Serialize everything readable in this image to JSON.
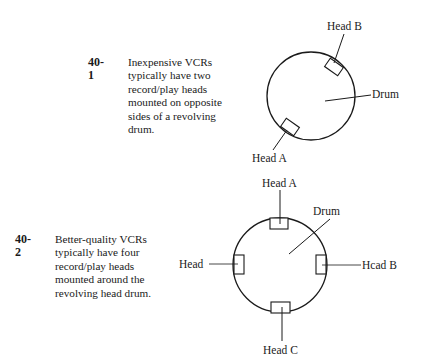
{
  "figures": [
    {
      "number": "40-1",
      "caption_lines": [
        "Inexpensive VCRs",
        "typically have two",
        "record/play heads",
        "mounted on opposite",
        "sides of a revolving",
        "drum."
      ],
      "labels": {
        "head_b": "Head B",
        "drum": "Drum",
        "head_a": "Head A"
      }
    },
    {
      "number": "40-2",
      "caption_lines": [
        "Better-quality VCRs",
        "typically have four",
        "record/play heads",
        "mounted around the",
        "revolving head drum."
      ],
      "labels": {
        "head_a": "Head A",
        "drum": "Drum",
        "head_left": "Head",
        "head_b": "Hcad B",
        "head_c": "Head C"
      }
    }
  ]
}
